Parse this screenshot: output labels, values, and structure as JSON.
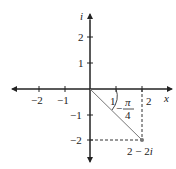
{
  "diagram": {
    "type": "complex-plane",
    "axes": {
      "x_label": "x",
      "y_label": "i",
      "x_ticks": [
        "−2",
        "−1",
        "1",
        "2"
      ],
      "y_ticks": [
        "2",
        "1",
        "−1",
        "−2"
      ]
    },
    "point": {
      "label": "2 − 2i",
      "re": 2,
      "im": -2
    },
    "angle": {
      "numerator": "π",
      "denominator": "4",
      "sign": "−"
    },
    "colors": {
      "axis": "#222222",
      "segment": "#777777",
      "dashed": "#333333"
    }
  }
}
